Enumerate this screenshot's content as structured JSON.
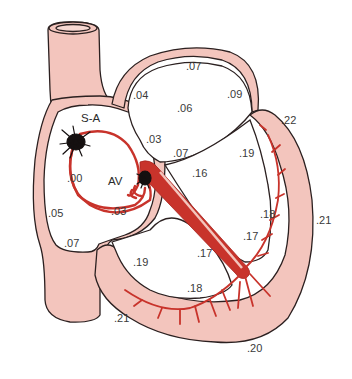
{
  "colors": {
    "tissue": "#f3c5bd",
    "outline": "#2b2020",
    "conduction": "#c8332b",
    "node": "#151010",
    "background": "#ffffff"
  },
  "nodes": {
    "sa": "S-A",
    "av": "AV"
  },
  "labels": [
    {
      "id": "la-top",
      "text": ".07",
      "x": 186,
      "y": 61
    },
    {
      "id": "la-left",
      "text": ".04",
      "x": 133,
      "y": 90
    },
    {
      "id": "la-center",
      "text": ".06",
      "x": 177,
      "y": 103
    },
    {
      "id": "la-right",
      "text": ".09",
      "x": 227,
      "y": 89
    },
    {
      "id": "septum-upper",
      "text": ".03",
      "x": 146,
      "y": 134
    },
    {
      "id": "bundle-his",
      "text": ".07",
      "x": 173,
      "y": 148
    },
    {
      "id": "lv-base",
      "text": ".22",
      "x": 281,
      "y": 115
    },
    {
      "id": "lv-endo-upper",
      "text": ".19",
      "x": 239,
      "y": 148
    },
    {
      "id": "ra-center",
      "text": ".00",
      "x": 67,
      "y": 173
    },
    {
      "id": "septum-lv",
      "text": ".16",
      "x": 192,
      "y": 168
    },
    {
      "id": "ra-lower",
      "text": ".03",
      "x": 111,
      "y": 206
    },
    {
      "id": "ra-left",
      "text": ".05",
      "x": 48,
      "y": 208
    },
    {
      "id": "lv-endo-mid",
      "text": ".18",
      "x": 260,
      "y": 209
    },
    {
      "id": "lv-epi",
      "text": ".21",
      "x": 316,
      "y": 215
    },
    {
      "id": "lv-endo-lower",
      "text": ".17",
      "x": 243,
      "y": 231
    },
    {
      "id": "ra-bottom",
      "text": ".07",
      "x": 64,
      "y": 238
    },
    {
      "id": "rv-septal",
      "text": ".17",
      "x": 197,
      "y": 248
    },
    {
      "id": "rv-upper",
      "text": ".19",
      "x": 133,
      "y": 257
    },
    {
      "id": "rv-lower",
      "text": ".18",
      "x": 187,
      "y": 283
    },
    {
      "id": "rv-epi",
      "text": ".21",
      "x": 114,
      "y": 313
    },
    {
      "id": "apex",
      "text": ".20",
      "x": 247,
      "y": 343
    }
  ]
}
